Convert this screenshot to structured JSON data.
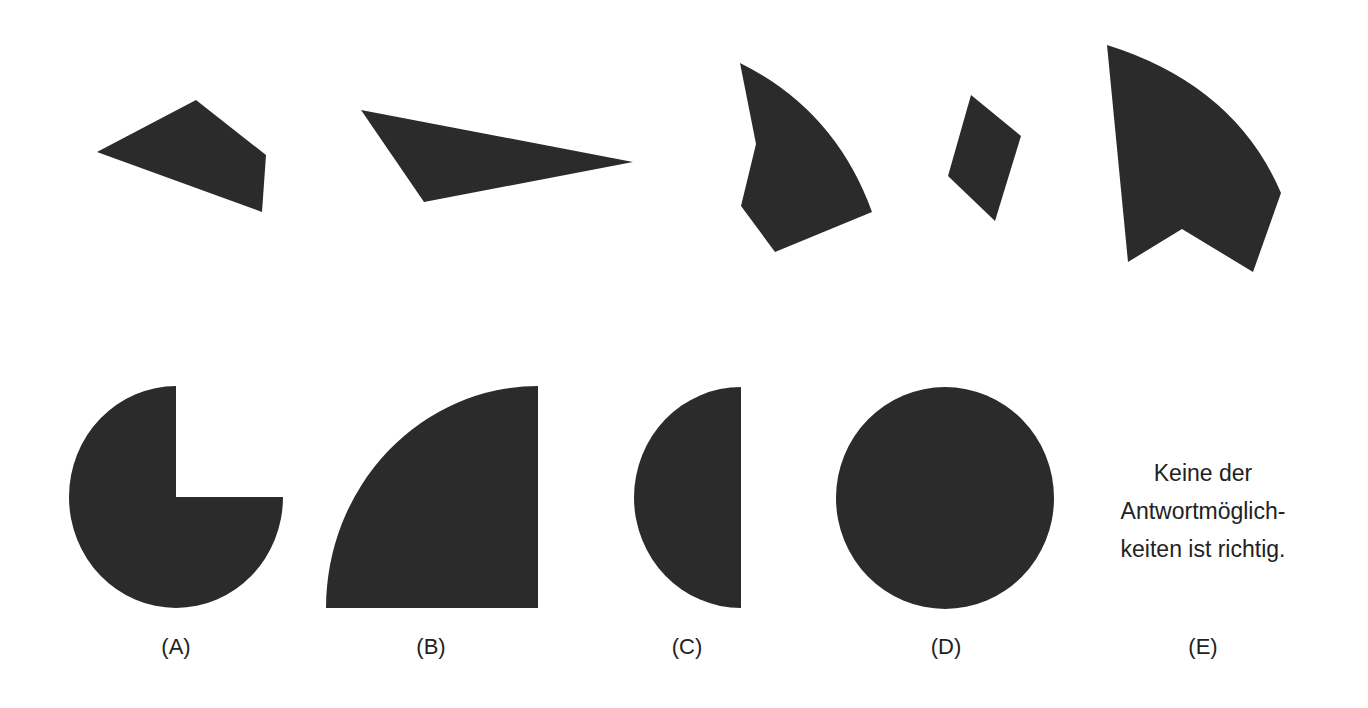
{
  "figure": {
    "fill_color": "#2b2b2b",
    "background_color": "#ffffff",
    "text_color": "#222222"
  },
  "puzzle_pieces": [
    {
      "id": "piece-1",
      "kind": "quadrilateral"
    },
    {
      "id": "piece-2",
      "kind": "triangle"
    },
    {
      "id": "piece-3",
      "kind": "curved-pentagon"
    },
    {
      "id": "piece-4",
      "kind": "parallelogram"
    },
    {
      "id": "piece-5",
      "kind": "curved-notched-sector"
    }
  ],
  "options": [
    {
      "label": "(A)",
      "kind": "three-quarter-circle"
    },
    {
      "label": "(B)",
      "kind": "quarter-circle"
    },
    {
      "label": "(C)",
      "kind": "half-ellipse"
    },
    {
      "label": "(D)",
      "kind": "circle"
    },
    {
      "label": "(E)",
      "kind": "text-answer",
      "text_lines": [
        "Keine der",
        "Antwortmöglich-",
        "keiten ist richtig."
      ]
    }
  ]
}
